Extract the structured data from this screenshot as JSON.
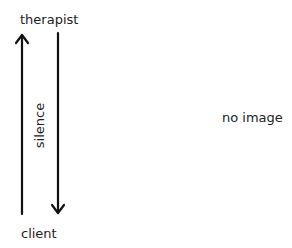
{
  "diagram": {
    "top_label": "therapist",
    "bottom_label": "client",
    "arrow_label": "silence",
    "placeholder": "no image",
    "arrows": [
      {
        "direction": "up",
        "from": "client",
        "to": "therapist"
      },
      {
        "direction": "down",
        "from": "therapist",
        "to": "client",
        "label": "silence"
      }
    ],
    "colors": {
      "line": "#111111",
      "text": "#222222"
    }
  }
}
